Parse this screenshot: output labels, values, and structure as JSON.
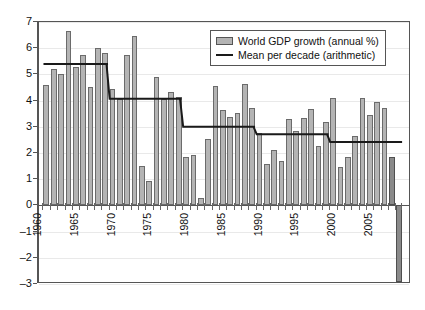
{
  "chart_data": {
    "type": "bar",
    "title": "",
    "xlabel": "",
    "ylabel": "",
    "ylim": [
      -3,
      7
    ],
    "y_ticks": [
      7,
      6,
      5,
      4,
      3,
      2,
      1,
      0,
      -1,
      -2,
      -3
    ],
    "x_tick_labels": [
      "1960",
      "1965",
      "1970",
      "1975",
      "1980",
      "1985",
      "1990",
      "1995",
      "2000",
      "2005"
    ],
    "x_tick_years": [
      1960,
      1965,
      1970,
      1975,
      1980,
      1985,
      1990,
      1995,
      2000,
      2005
    ],
    "grid": true,
    "legend_position": "top-right",
    "categories": [
      1961,
      1962,
      1963,
      1964,
      1965,
      1966,
      1967,
      1968,
      1969,
      1970,
      1971,
      1972,
      1973,
      1974,
      1975,
      1976,
      1977,
      1978,
      1979,
      1980,
      1981,
      1982,
      1983,
      1984,
      1985,
      1986,
      1987,
      1988,
      1989,
      1990,
      1991,
      1992,
      1993,
      1994,
      1995,
      1996,
      1997,
      1998,
      1999,
      2000,
      2001,
      2002,
      2003,
      2004,
      2005,
      2006,
      2007,
      2008,
      2009
    ],
    "series": [
      {
        "name": "World GDP growth (annual %)",
        "type": "bar",
        "color": "#b4b4b4",
        "highlight_color": "#8a8a8a",
        "highlight_categories": [
          2008,
          2009
        ],
        "values": [
          4.6,
          5.22,
          5.03,
          6.65,
          5.27,
          5.73,
          4.52,
          6.02,
          5.82,
          4.43,
          4.07,
          5.74,
          6.46,
          1.51,
          0.92,
          4.91,
          4.07,
          4.34,
          4.14,
          1.85,
          1.92,
          0.27,
          2.53,
          4.56,
          3.66,
          3.38,
          3.54,
          4.65,
          3.73,
          2.78,
          1.59,
          2.11,
          1.71,
          3.31,
          2.84,
          3.35,
          3.69,
          2.28,
          3.17,
          4.09,
          1.48,
          1.85,
          2.63,
          4.09,
          3.46,
          3.95,
          3.72,
          1.85,
          -2.91
        ]
      },
      {
        "name": "Mean per decade (arithmetic)",
        "type": "step-line",
        "color": "#1a1a1a",
        "segments": [
          {
            "start": 1961,
            "end": 1969,
            "value": 5.4
          },
          {
            "start": 1970,
            "end": 1979,
            "value": 4.07
          },
          {
            "start": 1980,
            "end": 1989,
            "value": 3.0
          },
          {
            "start": 1990,
            "end": 1999,
            "value": 2.72
          },
          {
            "start": 2000,
            "end": 2009,
            "value": 2.42
          }
        ]
      }
    ]
  },
  "legend": {
    "items": [
      {
        "label": "World GDP growth (annual %)",
        "marker": "bar-swatch"
      },
      {
        "label": "Mean per decade (arithmetic)",
        "marker": "line-swatch"
      }
    ]
  }
}
